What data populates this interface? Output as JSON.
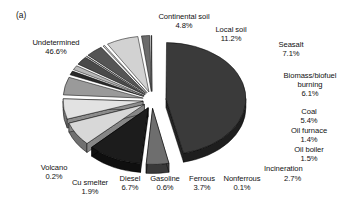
{
  "figure": {
    "panel_tag": "(a)",
    "background_color": "#ffffff",
    "text_color": "#111111"
  },
  "chart_data": {
    "type": "pie",
    "title": "",
    "subtitle": "",
    "xlabel": "",
    "ylabel": "",
    "units": "percent",
    "exploded": true,
    "three_d": true,
    "legend_position": "none",
    "labels_mode": "outside-callout",
    "grid": false,
    "categories": [
      "Undetermined",
      "Continental soil",
      "Local soil",
      "Seasalt",
      "Biomass/biofuel burning",
      "Coal",
      "Oil furnace",
      "Oil boiler",
      "Incineration",
      "Nonferrous",
      "Ferrous",
      "Gasoline",
      "Diesel",
      "Cu smelter",
      "Volcano"
    ],
    "values": [
      46.6,
      4.8,
      11.2,
      7.1,
      6.1,
      5.4,
      1.4,
      1.5,
      2.7,
      0.1,
      3.7,
      0.6,
      6.7,
      1.9,
      0.2
    ],
    "value_labels": [
      "46.6%",
      "4.8%",
      "11.2%",
      "7.1%",
      "6.1%",
      "5.4%",
      "1.4%",
      "1.5%",
      "2.7%",
      "0.1%",
      "3.7%",
      "0.6%",
      "6.7%",
      "1.9%",
      "0.2%"
    ],
    "slice_colors": [
      "#3a3a3a",
      "#6e6e6e",
      "#1c1c1c",
      "#d8d8d8",
      "#e2e2e2",
      "#9a9a9a",
      "#2a2a2a",
      "#b6b6b6",
      "#4a4a4a",
      "#8a8a8a",
      "#555555",
      "#c8c8c8",
      "#d2d2d2",
      "#6b6b6b",
      "#141414"
    ],
    "slices": [
      {
        "label": "Undetermined",
        "value": 46.6,
        "value_label": "46.6%",
        "color": "#3a3a3a"
      },
      {
        "label": "Continental soil",
        "value": 4.8,
        "value_label": "4.8%",
        "color": "#6e6e6e"
      },
      {
        "label": "Local soil",
        "value": 11.2,
        "value_label": "11.2%",
        "color": "#1c1c1c"
      },
      {
        "label": "Seasalt",
        "value": 7.1,
        "value_label": "7.1%",
        "color": "#d8d8d8"
      },
      {
        "label": "Biomass/biofuel burning",
        "value": 6.1,
        "value_label": "6.1%",
        "color": "#e2e2e2"
      },
      {
        "label": "Coal",
        "value": 5.4,
        "value_label": "5.4%",
        "color": "#9a9a9a"
      },
      {
        "label": "Oil furnace",
        "value": 1.4,
        "value_label": "1.4%",
        "color": "#2a2a2a"
      },
      {
        "label": "Oil boiler",
        "value": 1.5,
        "value_label": "1.5%",
        "color": "#b6b6b6"
      },
      {
        "label": "Incineration",
        "value": 2.7,
        "value_label": "2.7%",
        "color": "#4a4a4a"
      },
      {
        "label": "Nonferrous",
        "value": 0.1,
        "value_label": "0.1%",
        "color": "#8a8a8a"
      },
      {
        "label": "Ferrous",
        "value": 3.7,
        "value_label": "3.7%",
        "color": "#555555"
      },
      {
        "label": "Gasoline",
        "value": 0.6,
        "value_label": "0.6%",
        "color": "#c8c8c8"
      },
      {
        "label": "Diesel",
        "value": 6.7,
        "value_label": "6.7%",
        "color": "#d2d2d2"
      },
      {
        "label": "Cu smelter",
        "value": 1.9,
        "value_label": "1.9%",
        "color": "#6b6b6b"
      },
      {
        "label": "Volcano",
        "value": 0.2,
        "value_label": "0.2%",
        "color": "#141414"
      }
    ],
    "total": 100.0
  },
  "labels": {
    "undetermined": {
      "name": "Undetermined",
      "value": "46.6%"
    },
    "continental_soil": {
      "name": "Continental soil",
      "value": "4.8%"
    },
    "local_soil": {
      "name": "Local soil",
      "value": "11.2%"
    },
    "seasalt": {
      "name": "Seasalt",
      "value": "7.1%"
    },
    "biomass": {
      "name": "Biomass/biofuel burning",
      "value": "6.1%"
    },
    "coal": {
      "name": "Coal",
      "value": "5.4%"
    },
    "oil_furnace": {
      "name": "Oil furnace",
      "value": "1.4%"
    },
    "oil_boiler": {
      "name": "Oil boiler",
      "value": "1.5%"
    },
    "incineration": {
      "name": "Incineration",
      "value": "2.7%"
    },
    "nonferrous": {
      "name": "Nonferrous",
      "value": "0.1%"
    },
    "ferrous": {
      "name": "Ferrous",
      "value": "3.7%"
    },
    "gasoline": {
      "name": "Gasoline",
      "value": "0.6%"
    },
    "diesel": {
      "name": "Diesel",
      "value": "6.7%"
    },
    "cu_smelter": {
      "name": "Cu smelter",
      "value": "1.9%"
    },
    "volcano": {
      "name": "Volcano",
      "value": "0.2%"
    }
  }
}
